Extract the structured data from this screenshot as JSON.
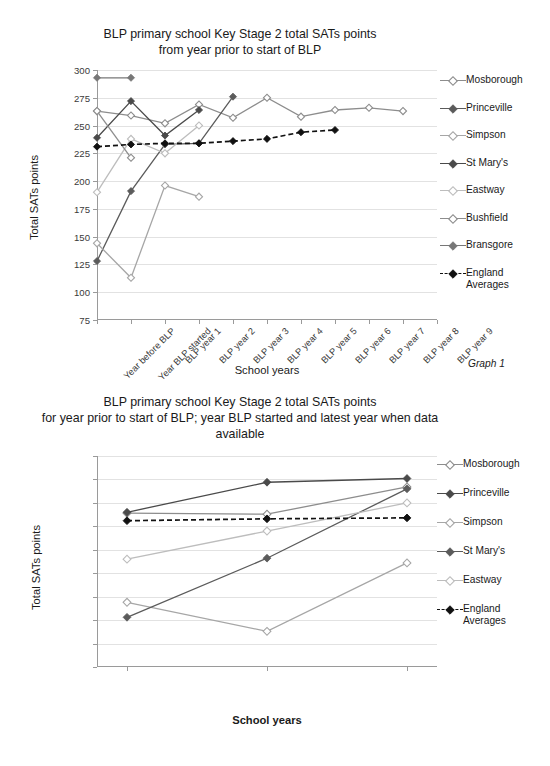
{
  "page": {
    "graph1_caption": "Graph 1",
    "graph2_caption": "Graph 2"
  },
  "chart_data": [
    {
      "id": "graph1",
      "type": "line",
      "title": "BLP primary school Key Stage 2 total SATs points\nfrom year prior to start of  BLP",
      "title_line1": "BLP primary school Key Stage 2 total SATs points",
      "title_line2": "from year prior to start of  BLP",
      "xlabel": "School years",
      "ylabel": "Total SATs points",
      "ylim": [
        75,
        300
      ],
      "yticks": [
        75,
        100,
        125,
        150,
        175,
        200,
        225,
        250,
        275,
        300
      ],
      "grid": true,
      "legend_position": "right",
      "categories": [
        "Year before BLP",
        "Year BLP started",
        "BLP year 1",
        "BLP year 2",
        "BLP year 3",
        "BLP year 4",
        "BLP year 5",
        "BLP year 6",
        "BLP year 7",
        "BLP year 8",
        "BLP year 9"
      ],
      "series": [
        {
          "name": "Mosborough",
          "color": "#8d8d8d",
          "marker": "diamond-open",
          "dash": "solid",
          "values": [
            263,
            259,
            252,
            269,
            257,
            275,
            258,
            264,
            266,
            263,
            null
          ]
        },
        {
          "name": "Princeville",
          "color": "#5b5b5b",
          "marker": "diamond-filled",
          "dash": "solid",
          "values": [
            128,
            191,
            233,
            234,
            276,
            null,
            null,
            null,
            null,
            null,
            null
          ]
        },
        {
          "name": "Simpson",
          "color": "#a6a6a6",
          "marker": "diamond-open",
          "dash": "solid",
          "values": [
            144,
            113,
            196,
            186,
            null,
            null,
            null,
            null,
            null,
            null,
            null
          ]
        },
        {
          "name": "St Mary's",
          "color": "#4a4a4a",
          "marker": "diamond-filled",
          "dash": "solid",
          "values": [
            239,
            272,
            241,
            264,
            null,
            null,
            null,
            null,
            null,
            null,
            null
          ]
        },
        {
          "name": "Eastway",
          "color": "#bdbdbd",
          "marker": "diamond-open",
          "dash": "solid",
          "values": [
            190,
            238,
            225,
            250,
            null,
            null,
            null,
            null,
            null,
            null,
            null
          ]
        },
        {
          "name": "Bushfield",
          "color": "#8d8d8d",
          "marker": "diamond-open",
          "dash": "solid",
          "values": [
            263,
            221,
            null,
            null,
            null,
            null,
            null,
            null,
            null,
            null,
            null
          ]
        },
        {
          "name": "Bransgore",
          "color": "#777777",
          "marker": "diamond-filled",
          "dash": "solid",
          "values": [
            293,
            293,
            null,
            null,
            null,
            null,
            null,
            null,
            null,
            null,
            null
          ]
        },
        {
          "name": "England\nAverages",
          "color": "#111111",
          "marker": "diamond-filled",
          "dash": "dashed",
          "values": [
            231,
            233,
            234,
            234,
            236,
            238,
            244,
            246,
            null,
            null,
            null
          ]
        }
      ]
    },
    {
      "id": "graph2",
      "type": "line",
      "title": "BLP primary school Key Stage 2 total SATs points\nfor year prior to start of BLP; year BLP started and latest year when data\navailable",
      "title_line1": "BLP primary school Key Stage 2 total SATs points",
      "title_line2": "for year prior to start of BLP; year BLP started and latest year when data",
      "title_line3": "available",
      "xlabel": "School years",
      "ylabel": "Total SATs points",
      "ylim": [
        75,
        300
      ],
      "yticks": [
        75,
        100,
        125,
        150,
        175,
        200,
        225,
        250,
        275,
        300
      ],
      "grid": true,
      "legend_position": "right",
      "categories": [
        "Year before BLP",
        "Year BLP started",
        "Latest year"
      ],
      "series": [
        {
          "name": "Mosborough",
          "color": "#8d8d8d",
          "marker": "diamond-open",
          "dash": "solid",
          "values": [
            239,
            238,
            267
          ]
        },
        {
          "name": "Princeville",
          "color": "#4a4a4a",
          "marker": "diamond-filled",
          "dash": "solid",
          "values": [
            240,
            272,
            276
          ]
        },
        {
          "name": "Simpson",
          "color": "#a6a6a6",
          "marker": "diamond-open",
          "dash": "solid",
          "values": [
            144,
            113,
            186
          ]
        },
        {
          "name": "St Mary's",
          "color": "#5b5b5b",
          "marker": "diamond-filled",
          "dash": "solid",
          "values": [
            128,
            191,
            265
          ]
        },
        {
          "name": "Eastway",
          "color": "#bdbdbd",
          "marker": "diamond-open",
          "dash": "solid",
          "values": [
            190,
            220,
            250
          ]
        },
        {
          "name": "England\nAverages",
          "color": "#111111",
          "marker": "diamond-filled",
          "dash": "dashed",
          "values": [
            231,
            233,
            234
          ]
        }
      ]
    }
  ]
}
